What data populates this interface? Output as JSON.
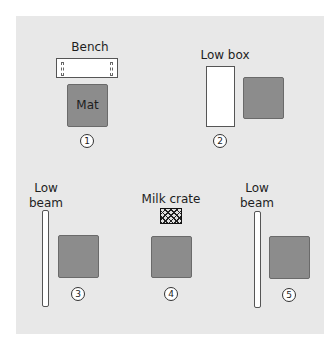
{
  "diagram": {
    "colors": {
      "background": "#ffffff",
      "panel": "#e8e8e8",
      "mat": "#8c8c8c",
      "equipment": "#ffffff",
      "outline": "#555555"
    },
    "stations": [
      {
        "number": "1",
        "equipment_label": "Bench",
        "equipment_icon": "bench-icon",
        "mat_label": "Mat"
      },
      {
        "number": "2",
        "equipment_label": "Low box",
        "equipment_icon": "low-box-icon",
        "mat_label": ""
      },
      {
        "number": "3",
        "equipment_label": "Low\nbeam",
        "equipment_icon": "low-beam-icon",
        "mat_label": ""
      },
      {
        "number": "4",
        "equipment_label": "Milk crate",
        "equipment_icon": "milk-crate-icon",
        "mat_label": ""
      },
      {
        "number": "5",
        "equipment_label": "Low\nbeam",
        "equipment_icon": "low-beam-icon",
        "mat_label": ""
      }
    ]
  }
}
